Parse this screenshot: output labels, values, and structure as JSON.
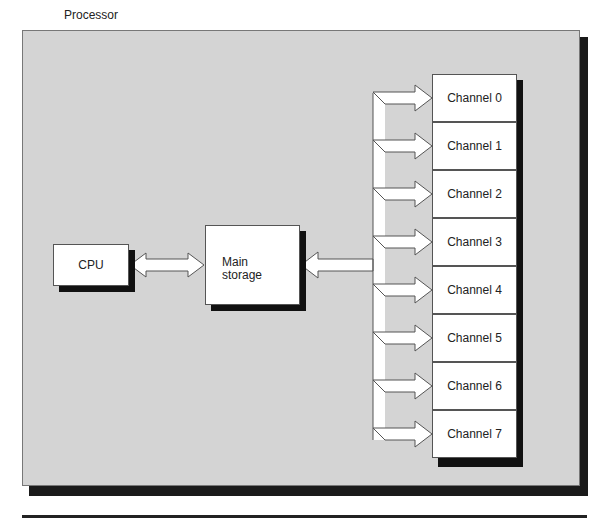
{
  "diagram": {
    "title": "Processor",
    "nodes": {
      "cpu": "CPU",
      "main_storage_line1": "Main",
      "main_storage_line2": "storage"
    },
    "channels": [
      "Channel 0",
      "Channel 1",
      "Channel 2",
      "Channel 3",
      "Channel 4",
      "Channel 5",
      "Channel 6",
      "Channel 7"
    ],
    "edges": [
      {
        "from": "CPU",
        "to": "Main storage",
        "type": "bidirectional-arrow"
      },
      {
        "from": "Channel bus",
        "to": "Main storage",
        "type": "arrow"
      },
      {
        "from": "Channel bus",
        "to": "Channel 0..7",
        "type": "arrows"
      }
    ],
    "colors": {
      "background": "#d4d4d4",
      "box": "#ffffff",
      "shadow": "#111111"
    }
  }
}
